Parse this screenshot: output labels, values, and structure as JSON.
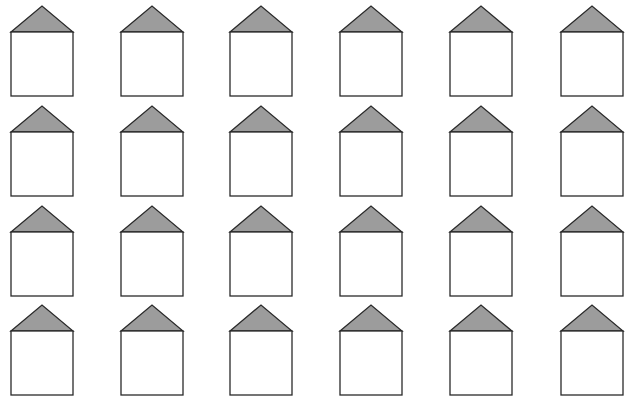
{
  "worksheet": {
    "title": "",
    "rows": 4,
    "columns": 6,
    "shape": "house",
    "colors": {
      "background": "#ffffff",
      "roof_fill": "#9c9c9c",
      "wall_fill": "#ffffff",
      "stroke": "#2a2a2a"
    },
    "column_x": [
      11,
      121,
      230,
      340,
      450,
      561
    ],
    "row_apex_y": [
      6,
      106,
      206,
      305
    ],
    "house": {
      "wall_width": 62,
      "roof_height": 26,
      "wall_height": 64
    }
  }
}
